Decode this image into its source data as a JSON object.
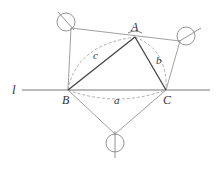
{
  "diagram": {
    "line_label": "l",
    "points": {
      "A": {
        "label": "A"
      },
      "B": {
        "label": "B"
      },
      "C": {
        "label": "C"
      }
    },
    "sides": {
      "a": "a",
      "b": "b",
      "c": "c"
    },
    "colors": {
      "triangle": "#444444",
      "construction": "#888888",
      "dashed": "#999999",
      "text": "#333333"
    }
  }
}
